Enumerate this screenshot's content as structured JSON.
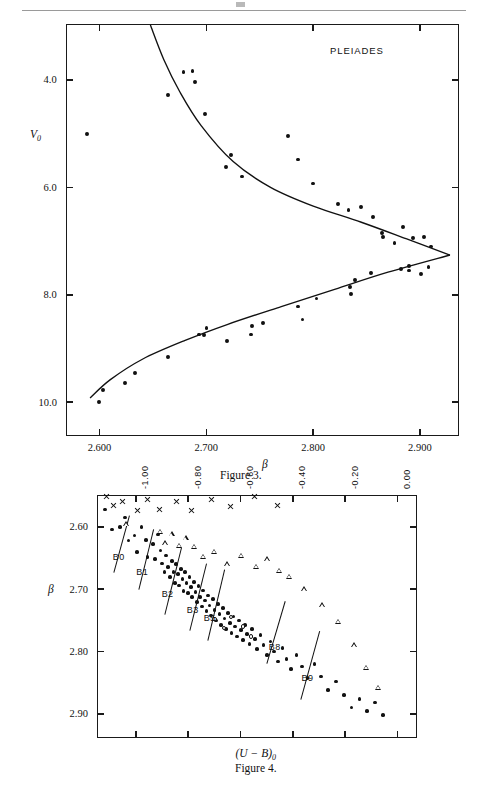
{
  "page": {
    "rule_present": true
  },
  "figure3": {
    "legend": "PLEIADES",
    "caption": "Figure 3.",
    "x_axis": {
      "name": "β",
      "ticks": [
        "2.600",
        "2.700",
        "2.800",
        "2.900"
      ],
      "tick_values": [
        2.6,
        2.7,
        2.8,
        2.9
      ],
      "range": [
        2.568,
        2.936
      ]
    },
    "y_axis": {
      "name": "V₀",
      "ticks": [
        "4.0",
        "6.0",
        "8.0",
        "10.0"
      ],
      "tick_values": [
        4.0,
        6.0,
        8.0,
        10.0
      ],
      "range": [
        2.95,
        10.62
      ],
      "inverted": true
    }
  },
  "figure4": {
    "caption": "Figure 4.",
    "x_axis": {
      "name": "(U − B)₀",
      "ticks": [
        "-1.00",
        "-0.80",
        "-0.60",
        "-0.40",
        "-0.20",
        "0.00"
      ],
      "tick_values": [
        -1.0,
        -0.8,
        -0.6,
        -0.4,
        -0.2,
        0.0
      ],
      "range": [
        -1.15,
        0.072
      ],
      "label_position": "top",
      "label_rotation": -90
    },
    "y_axis": {
      "name": "β",
      "ticks": [
        "2.60",
        "2.70",
        "2.80",
        "2.90"
      ],
      "tick_values": [
        2.6,
        2.7,
        2.8,
        2.9
      ],
      "range": [
        2.548,
        2.938
      ],
      "inverted": true
    },
    "spectral_labels": [
      {
        "text": "B0",
        "x": -1.065,
        "y": 2.648
      },
      {
        "text": "B1",
        "x": -0.975,
        "y": 2.672
      },
      {
        "text": "B2",
        "x": -0.878,
        "y": 2.707
      },
      {
        "text": "B3",
        "x": -0.782,
        "y": 2.733
      },
      {
        "text": "B5",
        "x": -0.718,
        "y": 2.746
      },
      {
        "text": "B8",
        "x": -0.469,
        "y": 2.792
      },
      {
        "text": "B9",
        "x": -0.344,
        "y": 2.843
      }
    ]
  },
  "chart_data": [
    {
      "type": "scatter",
      "title": "Figure 3",
      "annotation": "PLEIADES",
      "xlabel": "β",
      "ylabel": "V₀",
      "xlim": [
        2.568,
        2.936
      ],
      "ylim": [
        10.62,
        2.95
      ],
      "grid": false,
      "legend": "none",
      "series": [
        {
          "name": "Pleiades members",
          "marker": "filled-circle",
          "points": [
            [
              2.588,
              5.0
            ],
            [
              2.6785,
              3.86
            ],
            [
              2.687,
              3.83
            ],
            [
              2.689,
              4.04
            ],
            [
              2.664,
              4.28
            ],
            [
              2.699,
              4.63
            ],
            [
              2.723,
              5.4
            ],
            [
              2.718,
              5.62
            ],
            [
              2.733,
              5.8
            ],
            [
              2.776,
              5.04
            ],
            [
              2.786,
              5.48
            ],
            [
              2.8,
              5.93
            ],
            [
              2.823,
              6.31
            ],
            [
              2.833,
              6.42
            ],
            [
              2.8445,
              6.37
            ],
            [
              2.856,
              6.55
            ],
            [
              2.864,
              6.85
            ],
            [
              2.865,
              6.92
            ],
            [
              2.876,
              7.04
            ],
            [
              2.884,
              6.74
            ],
            [
              2.8935,
              6.95
            ],
            [
              2.904,
              6.92
            ],
            [
              2.91,
              7.1
            ],
            [
              2.882,
              7.52
            ],
            [
              2.8895,
              7.46
            ],
            [
              2.89,
              7.55
            ],
            [
              2.901,
              7.62
            ],
            [
              2.908,
              7.48
            ],
            [
              2.854,
              7.6
            ],
            [
              2.839,
              7.72
            ],
            [
              2.8345,
              7.85
            ],
            [
              2.835,
              7.99
            ],
            [
              2.803,
              8.07
            ],
            [
              2.786,
              8.22
            ],
            [
              2.79,
              8.46
            ],
            [
              2.753,
              8.52
            ],
            [
              2.743,
              8.58
            ],
            [
              2.742,
              8.74
            ],
            [
              2.719,
              8.86
            ],
            [
              2.7,
              8.62
            ],
            [
              2.698,
              8.75
            ],
            [
              2.693,
              8.74
            ],
            [
              2.664,
              9.16
            ],
            [
              2.633,
              9.46
            ],
            [
              2.624,
              9.65
            ],
            [
              2.603,
              9.78
            ],
            [
              2.599,
              9.99
            ]
          ]
        }
      ],
      "curves": [
        {
          "name": "upper-branch",
          "comment": "steeply descending then flattening to vertex",
          "path": [
            [
              2.6475,
              2.98
            ],
            [
              2.66,
              3.62
            ],
            [
              2.675,
              4.22
            ],
            [
              2.695,
              4.85
            ],
            [
              2.725,
              5.52
            ],
            [
              2.76,
              6.0
            ],
            [
              2.8,
              6.35
            ],
            [
              2.845,
              6.65
            ],
            [
              2.89,
              6.98
            ],
            [
              2.928,
              7.26
            ]
          ]
        },
        {
          "name": "lower-branch",
          "comment": "rising from lower-left to vertex",
          "path": [
            [
              2.591,
              9.92
            ],
            [
              2.61,
              9.58
            ],
            [
              2.64,
              9.2
            ],
            [
              2.68,
              8.85
            ],
            [
              2.72,
              8.55
            ],
            [
              2.77,
              8.22
            ],
            [
              2.82,
              7.9
            ],
            [
              2.87,
              7.58
            ],
            [
              2.928,
              7.26
            ]
          ]
        }
      ]
    },
    {
      "type": "scatter",
      "title": "Figure 4",
      "xlabel": "(U − B)₀",
      "ylabel": "β",
      "xlim": [
        -1.15,
        0.072
      ],
      "ylim": [
        2.938,
        2.548
      ],
      "grid": false,
      "legend": "none",
      "series": [
        {
          "name": "filled-circle stars",
          "marker": "filled-circle",
          "points": [
            [
              -1.118,
              2.572
            ],
            [
              -1.092,
              2.604
            ],
            [
              -1.06,
              2.6
            ],
            [
              -1.04,
              2.585
            ],
            [
              -1.028,
              2.622
            ],
            [
              -1.005,
              2.614
            ],
            [
              -0.996,
              2.64
            ],
            [
              -0.978,
              2.6
            ],
            [
              -0.962,
              2.621
            ],
            [
              -0.955,
              2.648
            ],
            [
              -0.935,
              2.628
            ],
            [
              -0.926,
              2.651
            ],
            [
              -0.916,
              2.612
            ],
            [
              -0.906,
              2.638
            ],
            [
              -0.899,
              2.659
            ],
            [
              -0.89,
              2.672
            ],
            [
              -0.884,
              2.646
            ],
            [
              -0.876,
              2.664
            ],
            [
              -0.87,
              2.68
            ],
            [
              -0.862,
              2.655
            ],
            [
              -0.856,
              2.672
            ],
            [
              -0.851,
              2.69
            ],
            [
              -0.846,
              2.66
            ],
            [
              -0.84,
              2.676
            ],
            [
              -0.835,
              2.694
            ],
            [
              -0.828,
              2.668
            ],
            [
              -0.822,
              2.684
            ],
            [
              -0.818,
              2.703
            ],
            [
              -0.812,
              2.672
            ],
            [
              -0.806,
              2.69
            ],
            [
              -0.8,
              2.706
            ],
            [
              -0.795,
              2.68
            ],
            [
              -0.789,
              2.697
            ],
            [
              -0.784,
              2.712
            ],
            [
              -0.778,
              2.688
            ],
            [
              -0.772,
              2.704
            ],
            [
              -0.767,
              2.72
            ],
            [
              -0.76,
              2.695
            ],
            [
              -0.754,
              2.712
            ],
            [
              -0.748,
              2.728
            ],
            [
              -0.742,
              2.702
            ],
            [
              -0.736,
              2.718
            ],
            [
              -0.73,
              2.735
            ],
            [
              -0.724,
              2.71
            ],
            [
              -0.718,
              2.726
            ],
            [
              -0.712,
              2.742
            ],
            [
              -0.705,
              2.716
            ],
            [
              -0.699,
              2.733
            ],
            [
              -0.693,
              2.75
            ],
            [
              -0.687,
              2.724
            ],
            [
              -0.68,
              2.74
            ],
            [
              -0.674,
              2.757
            ],
            [
              -0.668,
              2.73
            ],
            [
              -0.661,
              2.747
            ],
            [
              -0.655,
              2.764
            ],
            [
              -0.648,
              2.738
            ],
            [
              -0.641,
              2.754
            ],
            [
              -0.634,
              2.77
            ],
            [
              -0.627,
              2.744
            ],
            [
              -0.62,
              2.76
            ],
            [
              -0.613,
              2.776
            ],
            [
              -0.606,
              2.75
            ],
            [
              -0.598,
              2.766
            ],
            [
              -0.59,
              2.782
            ],
            [
              -0.582,
              2.758
            ],
            [
              -0.574,
              2.772
            ],
            [
              -0.566,
              2.788
            ],
            [
              -0.556,
              2.764
            ],
            [
              -0.546,
              2.78
            ],
            [
              -0.536,
              2.796
            ],
            [
              -0.524,
              2.774
            ],
            [
              -0.512,
              2.79
            ],
            [
              -0.5,
              2.806
            ],
            [
              -0.486,
              2.784
            ],
            [
              -0.472,
              2.8
            ],
            [
              -0.458,
              2.816
            ],
            [
              -0.44,
              2.794
            ],
            [
              -0.424,
              2.812
            ],
            [
              -0.406,
              2.828
            ],
            [
              -0.386,
              2.806
            ],
            [
              -0.366,
              2.824
            ],
            [
              -0.344,
              2.842
            ],
            [
              -0.318,
              2.82
            ],
            [
              -0.292,
              2.84
            ],
            [
              -0.266,
              2.862
            ],
            [
              -0.236,
              2.848
            ],
            [
              -0.206,
              2.87
            ],
            [
              -0.176,
              2.89
            ],
            [
              -0.146,
              2.876
            ],
            [
              -0.116,
              2.896
            ],
            [
              -0.086,
              2.882
            ],
            [
              -0.056,
              2.902
            ]
          ]
        },
        {
          "name": "open-triangle stars",
          "marker": "open-triangle",
          "points": [
            [
              -1.034,
              2.596
            ],
            [
              -0.905,
              2.608
            ],
            [
              -0.886,
              2.626
            ],
            [
              -0.862,
              2.612
            ],
            [
              -0.834,
              2.63
            ],
            [
              -0.808,
              2.618
            ],
            [
              -0.776,
              2.632
            ],
            [
              -0.742,
              2.648
            ],
            [
              -0.7,
              2.64
            ],
            [
              -0.65,
              2.66
            ],
            [
              -0.596,
              2.646
            ],
            [
              -0.54,
              2.664
            ],
            [
              -0.496,
              2.652
            ],
            [
              -0.452,
              2.67
            ],
            [
              -0.412,
              2.68
            ],
            [
              -0.356,
              2.7
            ],
            [
              -0.286,
              2.726
            ],
            [
              -0.226,
              2.752
            ],
            [
              -0.166,
              2.79
            ],
            [
              -0.118,
              2.826
            ],
            [
              -0.072,
              2.858
            ]
          ]
        },
        {
          "name": "cross stars",
          "marker": "cross",
          "points": [
            [
              -1.112,
              2.552
            ],
            [
              -1.086,
              2.566
            ],
            [
              -1.052,
              2.56
            ],
            [
              -0.992,
              2.574
            ],
            [
              -0.954,
              2.556
            ],
            [
              -0.908,
              2.572
            ],
            [
              -0.846,
              2.56
            ],
            [
              -0.788,
              2.574
            ],
            [
              -0.71,
              2.556
            ],
            [
              -0.638,
              2.568
            ],
            [
              -0.548,
              2.552
            ],
            [
              -0.46,
              2.566
            ]
          ]
        },
        {
          "name": "open-circle stars",
          "marker": "open-circle",
          "points": [
            [
              -0.7,
              2.748
            ],
            [
              -0.664,
              2.762
            ],
            [
              -0.636,
              2.744
            ],
            [
              -0.592,
              2.76
            ],
            [
              -0.56,
              2.776
            ]
          ]
        }
      ],
      "ridge_lines": [
        {
          "name": "B0",
          "from": [
            -1.082,
            2.672
          ],
          "to": [
            -1.022,
            2.58
          ]
        },
        {
          "name": "B1",
          "from": [
            -0.986,
            2.7
          ],
          "to": [
            -0.93,
            2.604
          ]
        },
        {
          "name": "B2",
          "from": [
            -0.888,
            2.74
          ],
          "to": [
            -0.824,
            2.632
          ]
        },
        {
          "name": "B3",
          "from": [
            -0.792,
            2.766
          ],
          "to": [
            -0.728,
            2.658
          ]
        },
        {
          "name": "B5",
          "from": [
            -0.726,
            2.782
          ],
          "to": [
            -0.662,
            2.668
          ]
        },
        {
          "name": "B8",
          "from": [
            -0.498,
            2.818
          ],
          "to": [
            -0.428,
            2.718
          ]
        },
        {
          "name": "B9",
          "from": [
            -0.368,
            2.876
          ],
          "to": [
            -0.296,
            2.766
          ]
        }
      ]
    }
  ]
}
